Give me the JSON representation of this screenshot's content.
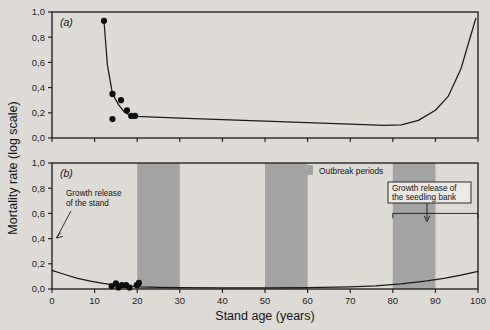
{
  "figure": {
    "y_axis_title": "Mortality rate (log scale)",
    "x_axis_title": "Stand age (years)",
    "panel_a_label": "(a)",
    "panel_b_label": "(b)",
    "legend_label": "Outbreak periods",
    "annotation_stand_line1": "Growth release",
    "annotation_stand_line2": "of the stand",
    "annotation_seedling_line1": "Growth release of",
    "annotation_seedling_line2": "the seedling bank",
    "colors": {
      "background": "#dedbd6",
      "band_gray": "#a3a3a3",
      "ink": "#1a1a1a",
      "point": "#0d0d0d"
    }
  },
  "chart_data": [
    {
      "type": "line",
      "panel": "(a)",
      "title": "",
      "xlabel": "",
      "ylabel": "Mortality rate (log scale)",
      "xlim": [
        0,
        100
      ],
      "ylim": [
        0,
        1.0
      ],
      "xticks": [
        0,
        10,
        20,
        30,
        40,
        50,
        60,
        70,
        80,
        90,
        100
      ],
      "xticklabels": [
        "",
        "",
        "",
        "",
        "",
        "",
        "",
        "",
        "",
        "",
        ""
      ],
      "yticks": [
        0.0,
        0.2,
        0.4,
        0.6,
        0.8,
        1.0
      ],
      "yticklabels": [
        "0,0",
        "0,2",
        "0,4",
        "0,6",
        "0,8",
        "1,0"
      ],
      "grid": false,
      "legend": "none",
      "series": [
        {
          "name": "mortality curve",
          "kind": "line",
          "x": [
            12.2,
            13.0,
            14.2,
            15.6,
            17.0,
            18.6,
            20.0,
            30.0,
            40.0,
            50.0,
            60.0,
            70.0,
            78.0,
            82.0,
            86.0,
            90.0,
            93.0,
            96.0,
            98.0,
            99.5
          ],
          "y": [
            0.93,
            0.58,
            0.35,
            0.265,
            0.205,
            0.175,
            0.172,
            0.158,
            0.146,
            0.134,
            0.122,
            0.11,
            0.1,
            0.105,
            0.14,
            0.22,
            0.33,
            0.55,
            0.78,
            0.95
          ]
        },
        {
          "name": "observed points",
          "kind": "scatter",
          "x": [
            12.2,
            14.2,
            14.2,
            16.2,
            17.6,
            18.6,
            19.5
          ],
          "y": [
            0.93,
            0.35,
            0.15,
            0.3,
            0.22,
            0.175,
            0.175
          ]
        }
      ]
    },
    {
      "type": "line",
      "panel": "(b)",
      "title": "",
      "xlabel": "Stand age (years)",
      "ylabel": "Mortality rate (log scale)",
      "xlim": [
        0,
        100
      ],
      "ylim": [
        0,
        1.0
      ],
      "xticks": [
        0,
        10,
        20,
        30,
        40,
        50,
        60,
        70,
        80,
        90,
        100
      ],
      "xticklabels": [
        "0",
        "10",
        "20",
        "30",
        "40",
        "50",
        "60",
        "70",
        "80",
        "90",
        "100"
      ],
      "yticks": [
        0.0,
        0.2,
        0.4,
        0.6,
        0.8,
        1.0
      ],
      "yticklabels": [
        "0,0",
        "0,2",
        "0,4",
        "0,6",
        "0,8",
        "1,0"
      ],
      "grid": false,
      "legend": "Outbreak periods",
      "shaded_bands": [
        {
          "label": "Outbreak periods",
          "x0": 20,
          "x1": 30
        },
        {
          "label": "Outbreak periods",
          "x0": 50,
          "x1": 60
        },
        {
          "label": "Outbreak periods",
          "x0": 80,
          "x1": 90
        }
      ],
      "bracket": {
        "label": "Growth release of the seedling bank",
        "x0": 80,
        "x1": 100,
        "y": 0.6
      },
      "series": [
        {
          "name": "mortality curve",
          "kind": "line",
          "x": [
            0.0,
            3.0,
            6.0,
            9.0,
            12.0,
            15.0,
            18.0,
            21.0,
            25.0,
            30.0,
            40.0,
            50.0,
            60.0,
            70.0,
            76.0,
            82.0,
            88.0,
            92.0,
            96.0,
            100.0
          ],
          "y": [
            0.148,
            0.115,
            0.085,
            0.062,
            0.044,
            0.031,
            0.022,
            0.016,
            0.012,
            0.01,
            0.009,
            0.009,
            0.01,
            0.016,
            0.024,
            0.04,
            0.065,
            0.085,
            0.11,
            0.14
          ]
        },
        {
          "name": "observed points",
          "kind": "scatter",
          "x": [
            14.0,
            15.0,
            15.6,
            16.4,
            17.4,
            18.2,
            19.9,
            20.4
          ],
          "y": [
            0.022,
            0.045,
            0.012,
            0.03,
            0.03,
            0.012,
            0.03,
            0.048
          ]
        }
      ]
    }
  ]
}
